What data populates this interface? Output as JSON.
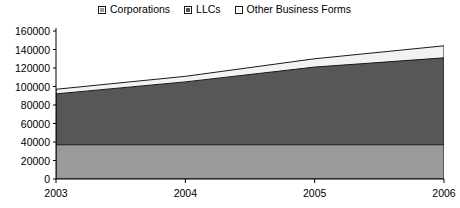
{
  "chart_data": {
    "type": "area",
    "stacked": true,
    "title": "",
    "subtitle": "",
    "xlabel": "",
    "ylabel": "",
    "categories": [
      "2003",
      "2004",
      "2005",
      "2006"
    ],
    "x_tick_labels": [
      "2003",
      "2004",
      "2005",
      "2006"
    ],
    "y_tick_labels": [
      "0",
      "20000",
      "40000",
      "60000",
      "80000",
      "100000",
      "120000",
      "140000",
      "160000"
    ],
    "y_ticks": [
      0,
      20000,
      40000,
      60000,
      80000,
      100000,
      120000,
      140000,
      160000
    ],
    "ylim": [
      0,
      160000
    ],
    "grid": false,
    "legend_position": "top-center",
    "series": [
      {
        "name": "Corporations",
        "color": "#9a9a9a",
        "values": [
          37000,
          37000,
          37000,
          37000
        ],
        "cumulative": [
          37000,
          37000,
          37000,
          37000
        ]
      },
      {
        "name": "LLCs",
        "color": "#575757",
        "values": [
          55000,
          68000,
          84000,
          94000
        ],
        "cumulative": [
          92000,
          105000,
          121000,
          131000
        ]
      },
      {
        "name": "Other Business Forms",
        "color": "#f2f2f2",
        "values": [
          5000,
          6000,
          9000,
          13000
        ],
        "cumulative": [
          97000,
          111000,
          130000,
          144000
        ]
      }
    ]
  },
  "legend": {
    "items": [
      {
        "label": "Corporations",
        "color": "#9a9a9a"
      },
      {
        "label": "LLCs",
        "color": "#575757"
      },
      {
        "label": "Other Business Forms",
        "color": "#f2f2f2"
      }
    ]
  },
  "axes": {
    "y_labels": [
      "160000",
      "140000",
      "120000",
      "100000",
      "80000",
      "60000",
      "40000",
      "20000",
      "0"
    ],
    "x_labels": [
      "2003",
      "2004",
      "2005",
      "2006"
    ]
  },
  "colors": {
    "axis": "#000000",
    "outline": "#1a1a1a",
    "background": "#ffffff"
  }
}
